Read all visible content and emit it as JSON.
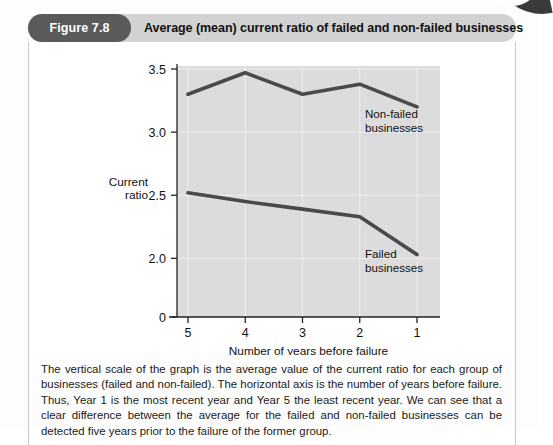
{
  "figure": {
    "badge_label": "Figure 7.8",
    "title": "Average (mean) current ratio of failed and non-failed businesses",
    "caption": "The vertical scale of the graph is the average value of the current ratio for each group of businesses (failed and non-failed). The horizontal axis is the number of years before failure. Thus, Year 1 is the most recent year and Year 5 the least recent year. We can see that a clear difference between the average for the failed and non-failed businesses can be detected five years prior to the failure of the former group."
  },
  "chart_data": {
    "type": "line",
    "title": "Average (mean) current ratio of failed and non-failed businesses",
    "xlabel": "Number of years before failure",
    "ylabel": "Current ratio",
    "ylabel_line1": "Current",
    "ylabel_line2": "ratio",
    "categories": [
      "5",
      "4",
      "3",
      "2",
      "1"
    ],
    "x": [
      5,
      4,
      3,
      2,
      1
    ],
    "series": [
      {
        "name": "Non-failed businesses",
        "label_line1": "Non-failed",
        "label_line2": "businesses",
        "values": [
          3.3,
          3.47,
          3.3,
          3.38,
          3.2
        ],
        "color": "#4a4a4a"
      },
      {
        "name": "Failed businesses",
        "label_line1": "Failed",
        "label_line2": "businesses",
        "values": [
          2.52,
          2.45,
          2.39,
          2.33,
          2.03
        ],
        "color": "#4a4a4a"
      }
    ],
    "ytick_labels": [
      "3.5",
      "3.0",
      "2.5",
      "2.0",
      "0"
    ],
    "ytick_values": [
      3.5,
      3.0,
      2.5,
      2.0,
      0
    ],
    "ylim": [
      1.75,
      3.5
    ],
    "axis_break": true,
    "grid": true,
    "plot_bg": "#dcdcdc",
    "grid_color": "#eeeeee",
    "legend_position": "inline-annotation"
  }
}
